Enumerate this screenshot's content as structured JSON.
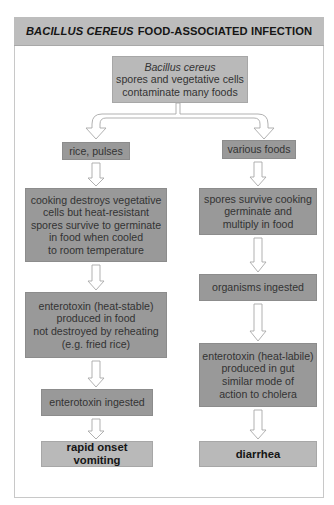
{
  "header": {
    "title_italic": "BACILLUS CEREUS",
    "title_rest": "FOOD-ASSOCIATED INFECTION"
  },
  "top_box": {
    "line1": "Bacillus cereus",
    "line2": "spores and vegetative cells",
    "line3": "contaminate many foods"
  },
  "left_branch": {
    "food": "rice, pulses",
    "step1": [
      "cooking destroys vegetative",
      "cells but heat-resistant",
      "spores survive to germinate",
      "in food when cooled",
      "to room temperature"
    ],
    "step2": [
      "enterotoxin (heat-stable)",
      "produced in food",
      "not destroyed by reheating",
      "(e.g. fried rice)"
    ],
    "step3": "enterotoxin ingested",
    "outcome": "rapid onset vomiting"
  },
  "right_branch": {
    "food": "various foods",
    "step1": [
      "spores survive cooking",
      "germinate and",
      "multiply in food"
    ],
    "step2": "organisms ingested",
    "step3": [
      "enterotoxin (heat-labile)",
      "produced in gut",
      "similar mode of",
      "action to cholera"
    ],
    "outcome": "diarrhea"
  },
  "colors": {
    "header_bg": "#bdbdbd",
    "dark_box": "#999999",
    "light_box": "#b9b9b9",
    "arrow_stroke": "#a8a8a8"
  }
}
